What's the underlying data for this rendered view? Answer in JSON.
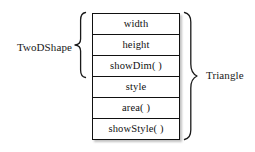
{
  "diagram": {
    "type": "class-hierarchy-brace-diagram",
    "background_color": "#ffffff",
    "line_color": "#111111",
    "text_color": "#1a1a1a",
    "left_group": {
      "label": "TwoDShape",
      "spans_members": [
        "width",
        "height",
        "showDim( )"
      ],
      "span_count": 3
    },
    "right_group": {
      "label": "Triangle",
      "spans_members": [
        "width",
        "height",
        "showDim( )",
        "style",
        "area( )",
        "showStyle( )"
      ],
      "span_count": 6
    },
    "members": [
      {
        "label": "width"
      },
      {
        "label": "height"
      },
      {
        "label": "showDim( )"
      },
      {
        "label": "style"
      },
      {
        "label": "area( )"
      },
      {
        "label": "showStyle( )"
      }
    ]
  }
}
